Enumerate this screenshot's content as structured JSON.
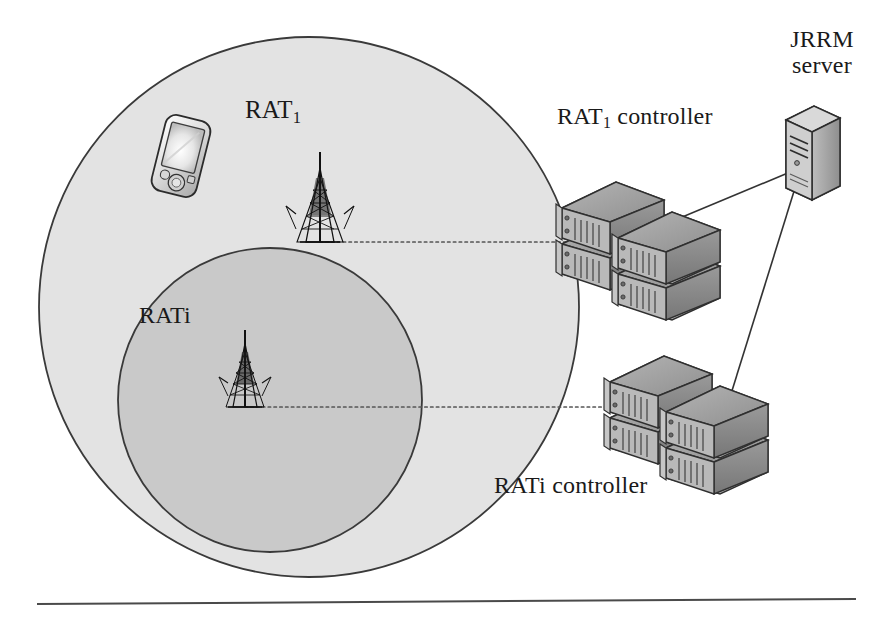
{
  "figure": {
    "type": "network-architecture-diagram",
    "background_color": "#ffffff"
  },
  "coverage_areas": [
    {
      "id": "rat1",
      "label_prefix": "RAT",
      "label_subscript": "1",
      "fill_color": "#e3e3e3",
      "stroke_color": "#3a3a3a",
      "center_x": 309,
      "center_y": 307,
      "radius": 270
    },
    {
      "id": "rati",
      "label": "RATi",
      "fill_color": "#c9c9c9",
      "stroke_color": "#3a3a3a",
      "center_x": 270,
      "center_y": 400,
      "radius": 152
    }
  ],
  "nodes": {
    "mobile_terminal": {
      "name": "mobile-phone",
      "x": 180,
      "y": 155
    },
    "tower_rat1": {
      "name": "cell-tower-rat1",
      "x": 320,
      "y": 242
    },
    "tower_rati": {
      "name": "cell-tower-rati",
      "x": 245,
      "y": 407
    },
    "rat1_controller": {
      "label_prefix": "RAT",
      "label_subscript": "1",
      "label_suffix": " controller",
      "x": 600,
      "y": 230
    },
    "rati_controller": {
      "label": "RATi controller",
      "x": 650,
      "y": 430
    },
    "jrrm_server": {
      "line1": "JRRM",
      "line2": "server",
      "x": 800,
      "y": 155
    }
  },
  "links": [
    {
      "name": "tower-rat1-to-rat1-controller",
      "style": "dotted",
      "from": "tower_rat1",
      "to": "rat1_controller",
      "color": "#555555"
    },
    {
      "name": "tower-rati-to-rati-controller",
      "style": "dotted",
      "from": "tower_rati",
      "to": "rati_controller",
      "color": "#555555"
    },
    {
      "name": "rat1-controller-to-jrrm-server",
      "style": "solid",
      "from": "rat1_controller",
      "to": "jrrm_server",
      "color": "#333333"
    },
    {
      "name": "rati-controller-to-jrrm-server",
      "style": "solid",
      "from": "rati_controller",
      "to": "jrrm_server",
      "color": "#333333"
    }
  ],
  "footer_rule": {
    "name": "horizontal-rule",
    "x1": 37,
    "y1": 604,
    "x2": 856,
    "y2": 599,
    "color": "#4a4a4a"
  }
}
